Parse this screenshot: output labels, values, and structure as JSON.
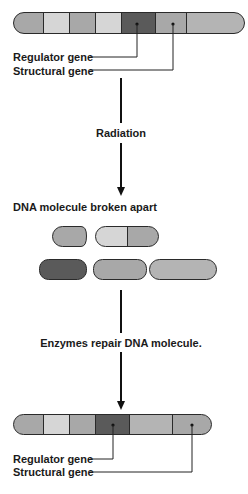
{
  "colors": {
    "light": "#d6d6d6",
    "medium": "#a8a8a8",
    "medium_light": "#b4b4b4",
    "dark": "#5a5a5a",
    "outline": "#2a2a2a",
    "text": "#1a1a1a"
  },
  "top_chromosome": {
    "segments": [
      "medium",
      "light",
      "medium",
      "light",
      "dark",
      "medium",
      "medium_light"
    ],
    "labels": {
      "regulator": "Regulator gene",
      "structural": "Structural gene"
    }
  },
  "steps": {
    "radiation": "Radiation",
    "broken": "DNA molecule broken apart",
    "repair": "Enzymes repair DNA molecule."
  },
  "fragments": [
    {
      "row": 1,
      "segments": [
        "medium"
      ]
    },
    {
      "row": 1,
      "segments": [
        "light",
        "medium"
      ]
    },
    {
      "row": 2,
      "segments": [
        "dark"
      ]
    },
    {
      "row": 2,
      "segments": [
        "medium"
      ]
    },
    {
      "row": 2,
      "segments": [
        "medium_light"
      ]
    }
  ],
  "bottom_chromosome": {
    "segments": [
      "medium",
      "light",
      "medium",
      "dark",
      "medium_light",
      "medium"
    ],
    "labels": {
      "regulator": "Regulator gene",
      "structural": "Structural gene"
    }
  }
}
